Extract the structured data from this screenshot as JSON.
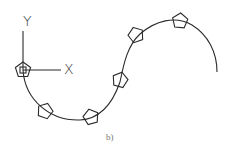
{
  "diagram": {
    "axis_labels": {
      "y": "Y",
      "x": "X"
    },
    "caption": "b)",
    "stroke_color": "#2a2a2a",
    "path": "S-shaped curve with pentagon markers along it",
    "pentagons": [
      {
        "x": 23,
        "y": 70,
        "rotate": 0
      },
      {
        "x": 45,
        "y": 111,
        "rotate": 20
      },
      {
        "x": 91,
        "y": 117,
        "rotate": -15
      },
      {
        "x": 120,
        "y": 80,
        "rotate": 15
      },
      {
        "x": 136,
        "y": 35,
        "rotate": -20
      },
      {
        "x": 180,
        "y": 21,
        "rotate": 5
      }
    ]
  }
}
